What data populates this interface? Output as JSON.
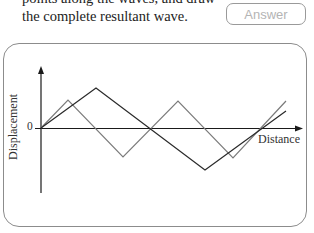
{
  "prompt": {
    "line1": "points along the waves, and draw",
    "line2": "the complete resultant wave."
  },
  "answer_button": {
    "label": "Answer"
  },
  "diagram": {
    "y_axis_label": "Displacement",
    "x_axis_label": "Distance",
    "origin_label": "0",
    "colors": {
      "axes": "#1a1a1a",
      "wave_gray": "#7a7a7a",
      "wave_black": "#2a2a2a",
      "panel_border": "#8c8c8c"
    },
    "waves": [
      {
        "name": "gray-wave",
        "description": "shorter wavelength triangular wave",
        "points_px": [
          [
            41,
            128
          ],
          [
            68,
            100
          ],
          [
            123,
            157
          ],
          [
            178,
            101
          ],
          [
            233,
            158
          ],
          [
            286,
            101
          ]
        ]
      },
      {
        "name": "black-wave",
        "description": "longer wavelength triangular wave",
        "points_px": [
          [
            41,
            128
          ],
          [
            96,
            88
          ],
          [
            205,
            170
          ],
          [
            286,
            111
          ]
        ]
      }
    ]
  }
}
